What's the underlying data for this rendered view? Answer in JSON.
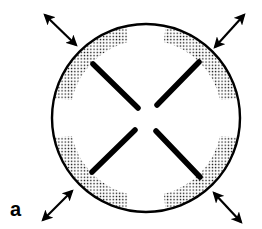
{
  "figure": {
    "panel_label": "a",
    "colors": {
      "stroke": "#000000",
      "background": "#ffffff",
      "stipple": "#000000"
    },
    "circle": {
      "cx": 146,
      "cy": 118,
      "r": 94
    },
    "segments": [
      {
        "name": "upper-left",
        "x1": 93,
        "y1": 64,
        "x2": 138,
        "y2": 108
      },
      {
        "name": "upper-right",
        "x1": 199,
        "y1": 62,
        "x2": 157,
        "y2": 105
      },
      {
        "name": "lower-left",
        "x1": 135,
        "y1": 130,
        "x2": 92,
        "y2": 172
      },
      {
        "name": "lower-right",
        "x1": 156,
        "y1": 131,
        "x2": 200,
        "y2": 177
      }
    ],
    "arrows": [
      {
        "name": "top-left",
        "x1": 45,
        "y1": 15,
        "x2": 76,
        "y2": 45
      },
      {
        "name": "top-right",
        "x1": 244,
        "y1": 15,
        "x2": 215,
        "y2": 47
      },
      {
        "name": "bottom-left",
        "x1": 43,
        "y1": 220,
        "x2": 72,
        "y2": 191
      },
      {
        "name": "bottom-right",
        "x1": 214,
        "y1": 193,
        "x2": 241,
        "y2": 222
      }
    ],
    "stippled_regions": [
      "upper-left",
      "upper-right",
      "lower-left",
      "lower-right"
    ]
  }
}
